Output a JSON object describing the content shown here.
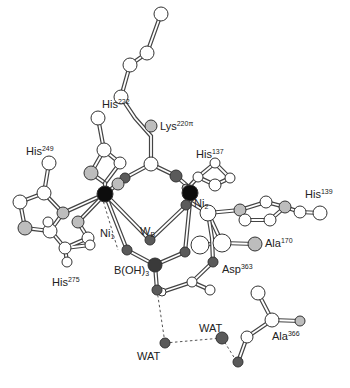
{
  "figure": {
    "type": "ball-and-stick active site diagram",
    "colors": {
      "carbon": "#ffffff",
      "nitrogen": "#bdbdbd",
      "oxygen": "#5a5a5a",
      "nickel": "#0d0d0d",
      "boron": "#3a3a3a",
      "bond_outline": "#444444",
      "hbond": "#555555"
    }
  },
  "labels": [
    {
      "id": "his222",
      "base": "His",
      "sup": "222",
      "sub": "",
      "x": 102,
      "y": 98
    },
    {
      "id": "lys220",
      "base": "Lys",
      "sup": "220π",
      "sub": "",
      "x": 160,
      "y": 120
    },
    {
      "id": "his249",
      "base": "His",
      "sup": "249",
      "sub": "",
      "x": 26,
      "y": 145
    },
    {
      "id": "his137",
      "base": "His",
      "sup": "137",
      "sub": "",
      "x": 196,
      "y": 148
    },
    {
      "id": "his139",
      "base": "His",
      "sup": "139",
      "sub": "",
      "x": 307,
      "y": 190
    },
    {
      "id": "ni2",
      "base": "Ni",
      "sup": "",
      "sub": "2",
      "x": 194,
      "y": 198
    },
    {
      "id": "ni1",
      "base": "Ni",
      "sup": "",
      "sub": "1",
      "x": 100,
      "y": 228
    },
    {
      "id": "wb",
      "base": "W",
      "sup": "",
      "sub": "B",
      "x": 140,
      "y": 228
    },
    {
      "id": "ala170",
      "base": "Ala",
      "sup": "170",
      "sub": "",
      "x": 260,
      "y": 237
    },
    {
      "id": "boh3",
      "base": "B(OH)",
      "sup": "",
      "sub": "3",
      "x": 115,
      "y": 265
    },
    {
      "id": "asp363",
      "base": "Asp",
      "sup": "363",
      "sub": "",
      "x": 220,
      "y": 263
    },
    {
      "id": "his275",
      "base": "His",
      "sup": "275",
      "sub": "",
      "x": 52,
      "y": 277
    },
    {
      "id": "wat1",
      "base": "WAT",
      "sup": "",
      "sub": "",
      "x": 199,
      "y": 324
    },
    {
      "id": "ala366",
      "base": "Ala",
      "sup": "366",
      "sub": "",
      "x": 272,
      "y": 333
    },
    {
      "id": "wat2",
      "base": "WAT",
      "sup": "",
      "sub": "",
      "x": 137,
      "y": 351
    }
  ]
}
